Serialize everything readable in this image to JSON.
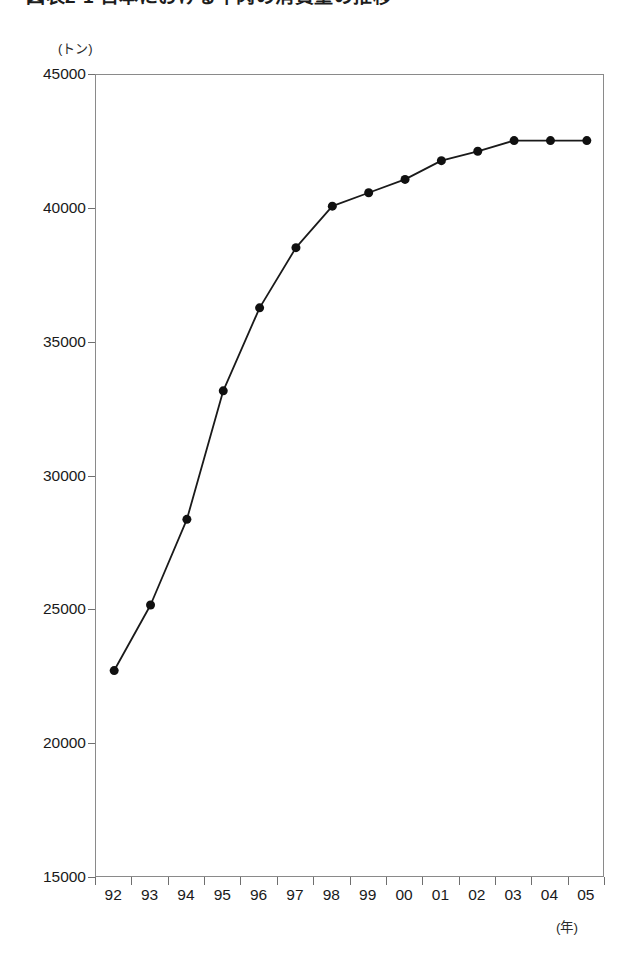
{
  "title": "図表2-1 日本における牛肉の消費量の推移",
  "unit_label": "(トン)",
  "x_axis_unit": "(年)",
  "colors": {
    "line": "#1a1a1a",
    "marker": "#101010",
    "axis": "#8a8a8a",
    "tick": "#6f6f6f",
    "text": "#1a1a1a",
    "background": "#ffffff"
  },
  "chart_data": {
    "type": "line",
    "title": "図表2-1 日本における牛肉の消費量の推移",
    "xlabel": "(年)",
    "ylabel": "(トン)",
    "ylim": [
      15000,
      45000
    ],
    "ytick_values": [
      45000,
      40000,
      35000,
      30000,
      25000,
      20000,
      15000
    ],
    "ytick_labels": [
      "45000",
      "40000",
      "35000",
      "30000",
      "25000",
      "20000",
      "15000"
    ],
    "categories": [
      "92",
      "93",
      "94",
      "95",
      "96",
      "97",
      "98",
      "99",
      "00",
      "01",
      "02",
      "03",
      "04",
      "05"
    ],
    "values": [
      22750,
      25200,
      28400,
      33200,
      36300,
      38550,
      40100,
      40600,
      41100,
      41800,
      42150,
      42550,
      42550,
      42550
    ],
    "grid": false,
    "legend": false,
    "markers": "filled-circle",
    "marker_size": 9
  }
}
